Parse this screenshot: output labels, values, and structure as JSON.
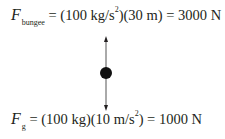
{
  "equations": {
    "bungee": {
      "symbol": "F",
      "subscript": "bungee",
      "eq1": " = (100 kg/s",
      "exp1": "2",
      "eq2": ")(30 m) = 3000 N"
    },
    "gravity": {
      "symbol": "F",
      "subscript": "g",
      "eq1": " = (100 kg)(10 m/s",
      "exp1": "2",
      "eq2": ") = 1000 N"
    }
  },
  "diagram": {
    "object": "point-mass",
    "forces": [
      {
        "name": "bungee-force",
        "direction": "up",
        "magnitude_N": 3000
      },
      {
        "name": "gravity-force",
        "direction": "down",
        "magnitude_N": 1000
      }
    ],
    "colors": {
      "ink": "#231f20",
      "line": "#555555"
    }
  }
}
